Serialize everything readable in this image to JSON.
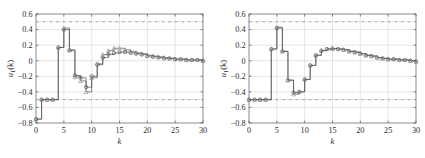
{
  "figure": {
    "background": "#ffffff",
    "panel_count": 2
  },
  "style": {
    "axis_color": "#5a5a5a",
    "grid_color": "#c8c8c8",
    "line_color": "#4a4a4a",
    "circle_marker_color": "#3c3c3c",
    "triangle_marker_color": "#909090",
    "constraint_color": "#7a7a7a",
    "text_color": "#2b2b2b"
  },
  "chart_data": [
    {
      "id": "left-panel",
      "type": "line",
      "drawstyle": "steps-post",
      "title": "",
      "xlabel": "k",
      "ylabel": "u₁(k)",
      "ylabel_base": "u",
      "ylabel_sub": "1",
      "ylabel_arg": "(k)",
      "xlim": [
        0,
        30
      ],
      "ylim": [
        -0.8,
        0.6
      ],
      "xticks": [
        0,
        5,
        10,
        15,
        20,
        25,
        30
      ],
      "xticklabels": [
        "0",
        "5",
        "10",
        "15",
        "20",
        "25",
        "30"
      ],
      "yticks": [
        -0.8,
        -0.6,
        -0.4,
        -0.2,
        0,
        0.2,
        0.4,
        0.6
      ],
      "yticklabels": [
        "−0.8",
        "−0.6",
        "−0.4",
        "−0.2",
        "0",
        "0.2",
        "0.4",
        "0.6"
      ],
      "grid": true,
      "legend": "none",
      "annotations": [
        {
          "kind": "hline",
          "value": 0.5,
          "style": "dash-dot",
          "label": "upper input constraint"
        },
        {
          "kind": "hline",
          "value": -0.5,
          "style": "dash-dot",
          "label": "lower input constraint"
        }
      ],
      "x": [
        0,
        1,
        2,
        3,
        4,
        5,
        6,
        7,
        8,
        9,
        10,
        11,
        12,
        13,
        14,
        15,
        16,
        17,
        18,
        19,
        20,
        21,
        22,
        23,
        24,
        25,
        26,
        27,
        28,
        29,
        30
      ],
      "series": [
        {
          "name": "circle-series",
          "marker": "o",
          "values": [
            -0.75,
            -0.5,
            -0.5,
            -0.5,
            0.17,
            0.4,
            0.13,
            -0.19,
            -0.22,
            -0.34,
            -0.2,
            -0.05,
            0.04,
            0.08,
            0.1,
            0.11,
            0.11,
            0.1,
            0.09,
            0.08,
            0.06,
            0.05,
            0.04,
            0.03,
            0.03,
            0.02,
            0.02,
            0.01,
            0.01,
            0.01,
            0.0
          ]
        },
        {
          "name": "triangle-series",
          "marker": "^",
          "values": [
            -0.75,
            -0.5,
            -0.5,
            -0.5,
            0.17,
            0.42,
            0.14,
            -0.21,
            -0.26,
            -0.4,
            -0.22,
            -0.04,
            0.08,
            0.13,
            0.16,
            0.16,
            0.14,
            0.12,
            0.1,
            0.09,
            0.07,
            0.06,
            0.05,
            0.04,
            0.03,
            0.02,
            0.02,
            0.01,
            0.01,
            0.01,
            0.0
          ]
        }
      ]
    },
    {
      "id": "right-panel",
      "type": "line",
      "drawstyle": "steps-post",
      "title": "",
      "xlabel": "k",
      "ylabel": "u₁(k)",
      "ylabel_base": "u",
      "ylabel_sub": "1",
      "ylabel_arg": "(k)",
      "xlim": [
        0,
        30
      ],
      "ylim": [
        -0.8,
        0.6
      ],
      "xticks": [
        0,
        5,
        10,
        15,
        20,
        25,
        30
      ],
      "xticklabels": [
        "0",
        "5",
        "10",
        "15",
        "20",
        "25",
        "30"
      ],
      "yticks": [
        -0.8,
        -0.6,
        -0.4,
        -0.2,
        0,
        0.2,
        0.4,
        0.6
      ],
      "yticklabels": [
        "−0.8",
        "−0.6",
        "−0.4",
        "−0.2",
        "0",
        "0.2",
        "0.4",
        "0.6"
      ],
      "grid": true,
      "legend": "none",
      "annotations": [
        {
          "kind": "hline",
          "value": 0.5,
          "style": "dash-dot",
          "label": "upper input constraint"
        },
        {
          "kind": "hline",
          "value": -0.5,
          "style": "dash-dot",
          "label": "lower input constraint"
        }
      ],
      "x": [
        0,
        1,
        2,
        3,
        4,
        5,
        6,
        7,
        8,
        9,
        10,
        11,
        12,
        13,
        14,
        15,
        16,
        17,
        18,
        19,
        20,
        21,
        22,
        23,
        24,
        25,
        26,
        27,
        28,
        29,
        30
      ],
      "series": [
        {
          "name": "circle-series",
          "marker": "o",
          "values": [
            -0.5,
            -0.5,
            -0.5,
            -0.5,
            0.15,
            0.42,
            0.12,
            -0.25,
            -0.41,
            -0.4,
            -0.24,
            -0.06,
            0.07,
            0.13,
            0.15,
            0.155,
            0.15,
            0.14,
            0.12,
            0.11,
            0.09,
            0.07,
            0.06,
            0.04,
            0.03,
            0.02,
            0.02,
            0.01,
            0.01,
            0.0,
            -0.01
          ]
        },
        {
          "name": "triangle-series",
          "marker": "^",
          "values": [
            -0.5,
            -0.5,
            -0.5,
            -0.5,
            0.15,
            0.43,
            0.12,
            -0.25,
            -0.43,
            -0.4,
            -0.24,
            -0.06,
            0.07,
            0.13,
            0.15,
            0.155,
            0.15,
            0.14,
            0.12,
            0.11,
            0.09,
            0.07,
            0.06,
            0.04,
            0.03,
            0.02,
            0.02,
            0.01,
            0.01,
            0.0,
            -0.01
          ]
        }
      ]
    }
  ]
}
